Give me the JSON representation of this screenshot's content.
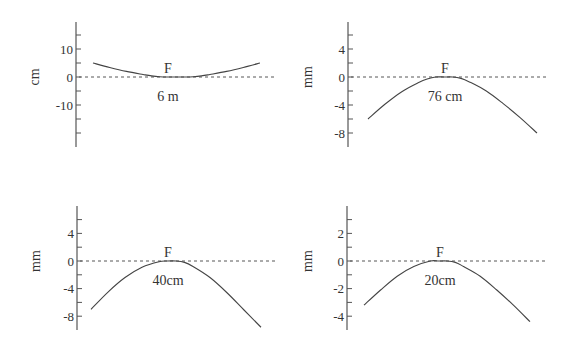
{
  "chart_data": [
    {
      "type": "line",
      "panel": "top-left",
      "ylabel": "cm",
      "annotation_peak": "F",
      "annotation_distance": "6 m",
      "yticks_labeled": [
        10,
        0,
        -10
      ],
      "ylim": [
        -22,
        22
      ],
      "xlim": [
        0,
        1
      ],
      "reference_line": 0,
      "series": [
        {
          "name": "profile",
          "x": [
            0.0,
            0.1,
            0.2,
            0.3,
            0.35,
            0.4,
            0.45,
            0.5,
            0.55,
            0.6,
            0.65,
            0.7,
            0.8,
            0.9,
            1.0
          ],
          "y": [
            5.0,
            3.4,
            2.0,
            0.9,
            0.4,
            0.1,
            0.0,
            0.0,
            0.0,
            0.1,
            0.4,
            0.9,
            2.0,
            3.4,
            5.0
          ]
        }
      ]
    },
    {
      "type": "line",
      "panel": "top-right",
      "ylabel": "mm",
      "annotation_peak": "F",
      "annotation_distance": "76 cm",
      "yticks_labeled": [
        4,
        0,
        -4,
        -8
      ],
      "ylim": [
        -10,
        8
      ],
      "xlim": [
        0,
        1
      ],
      "reference_line": 0,
      "series": [
        {
          "name": "profile",
          "x": [
            0.0,
            0.1,
            0.2,
            0.3,
            0.35,
            0.4,
            0.45,
            0.5,
            0.55,
            0.6,
            0.7,
            0.8,
            0.9,
            1.0
          ],
          "y": [
            -6.0,
            -3.9,
            -2.1,
            -0.8,
            -0.3,
            0.0,
            0.0,
            0.0,
            -0.2,
            -0.7,
            -2.0,
            -3.8,
            -5.8,
            -8.0
          ]
        }
      ]
    },
    {
      "type": "line",
      "panel": "bottom-left",
      "ylabel": "mm",
      "annotation_peak": "F",
      "annotation_distance": "40cm",
      "yticks_labeled": [
        4,
        0,
        -4,
        -8
      ],
      "ylim": [
        -10,
        8
      ],
      "xlim": [
        0,
        1
      ],
      "reference_line": 0,
      "series": [
        {
          "name": "profile",
          "x": [
            0.0,
            0.1,
            0.2,
            0.3,
            0.4,
            0.45,
            0.5,
            0.55,
            0.6,
            0.7,
            0.8,
            0.9,
            1.0
          ],
          "y": [
            -7.0,
            -4.5,
            -2.4,
            -0.9,
            -0.1,
            0.0,
            0.0,
            -0.2,
            -0.8,
            -2.4,
            -4.6,
            -7.1,
            -9.6
          ]
        }
      ]
    },
    {
      "type": "line",
      "panel": "bottom-right",
      "ylabel": "mm",
      "annotation_peak": "F",
      "annotation_distance": "20cm",
      "yticks_labeled": [
        2,
        0,
        -2,
        -4
      ],
      "ylim": [
        -5,
        4
      ],
      "xlim": [
        0,
        1
      ],
      "reference_line": 0,
      "series": [
        {
          "name": "profile",
          "x": [
            0.0,
            0.1,
            0.2,
            0.3,
            0.4,
            0.45,
            0.5,
            0.55,
            0.6,
            0.7,
            0.8,
            0.9,
            1.0
          ],
          "y": [
            -3.2,
            -2.1,
            -1.1,
            -0.4,
            0.0,
            0.0,
            0.0,
            -0.1,
            -0.4,
            -1.1,
            -2.1,
            -3.2,
            -4.4
          ]
        }
      ]
    }
  ],
  "layout": {
    "panels": [
      {
        "axis_x": 76,
        "axis_top": 22,
        "axis_bottom": 147,
        "zero_y": 77,
        "px_per_unit": 2.8,
        "minor_step": 5,
        "major_step": 10,
        "curve_x0": 93,
        "curve_x1": 260,
        "dash_x1": 275,
        "unit_x": 35,
        "label_x": 168
      },
      {
        "axis_x": 348,
        "axis_top": 22,
        "axis_bottom": 147,
        "zero_y": 77,
        "px_per_unit": 7.0,
        "minor_step": 2,
        "major_step": 4,
        "curve_x0": 368,
        "curve_x1": 537,
        "dash_x1": 549,
        "unit_x": 308,
        "label_x": 445
      },
      {
        "axis_x": 77,
        "axis_top": 206,
        "axis_bottom": 330,
        "zero_y": 261,
        "px_per_unit": 6.9,
        "minor_step": 2,
        "major_step": 4,
        "curve_x0": 91,
        "curve_x1": 261,
        "dash_x1": 276,
        "unit_x": 36,
        "label_x": 168
      },
      {
        "axis_x": 347,
        "axis_top": 206,
        "axis_bottom": 330,
        "zero_y": 261,
        "px_per_unit": 13.8,
        "minor_step": 1,
        "major_step": 2,
        "curve_x0": 364,
        "curve_x1": 530,
        "dash_x1": 548,
        "unit_x": 308,
        "label_x": 440
      }
    ]
  }
}
